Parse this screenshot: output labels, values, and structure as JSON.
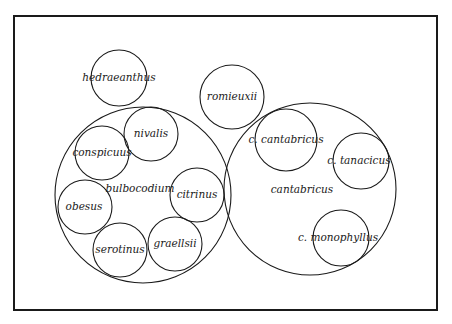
{
  "diagram": {
    "type": "nested-circle-taxonomy",
    "frame": {
      "x": 14,
      "y": 16,
      "width": 423,
      "height": 294
    },
    "line_color": "#1a1a1a",
    "background": "#ffffff",
    "groups": [
      {
        "id": "hedraeanthus",
        "label": "hedraeanthus",
        "cx": 119,
        "cy": 78,
        "r": 28
      },
      {
        "id": "romieuxii",
        "label": "romieuxii",
        "cx": 232,
        "cy": 97,
        "r": 32
      },
      {
        "id": "bulbocodium",
        "label": "bulbocodium",
        "cx": 143,
        "cy": 189,
        "r": 88,
        "label_pos": {
          "x": 138,
          "y": 192
        },
        "members": [
          {
            "id": "nivalis",
            "label": "nivalis",
            "cx": 151,
            "cy": 133,
            "r": 27
          },
          {
            "id": "conspicuus",
            "label": "conspicuus",
            "cx": 102,
            "cy": 153,
            "r": 27
          },
          {
            "id": "obesus",
            "label": "obesus",
            "cx": 85,
            "cy": 207,
            "r": 27
          },
          {
            "id": "citrinus",
            "label": "citrinus",
            "cx": 199,
            "cy": 194,
            "r": 27
          },
          {
            "id": "serotinus",
            "label": "serotinus",
            "cx": 120,
            "cy": 250,
            "r": 27
          },
          {
            "id": "graellsii",
            "label": "graellsii",
            "cx": 175,
            "cy": 245,
            "r": 27
          }
        ]
      },
      {
        "id": "cantabricus",
        "label": "cantabricus",
        "cx": 310,
        "cy": 189,
        "r": 86,
        "label_pos": {
          "x": 300,
          "y": 193
        },
        "members": [
          {
            "id": "c-cantabricus",
            "label": "c. cantabricus",
            "cx": 286,
            "cy": 140,
            "r": 31
          },
          {
            "id": "c-tanacicus",
            "label": "c. tanacicus",
            "cx": 361,
            "cy": 161,
            "r": 28
          },
          {
            "id": "c-monophyllus",
            "label": "c. monophyllus",
            "cx": 341,
            "cy": 238,
            "r": 28
          }
        ]
      }
    ]
  },
  "labels": {
    "hedraeanthus": "hedraeanthus",
    "romieuxii": "romieuxii",
    "bulbocodium": "bulbocodium",
    "nivalis": "nivalis",
    "conspicuus": "conspicuus",
    "obesus": "obesus",
    "citrinus": "citrinus",
    "serotinus": "serotinus",
    "graellsii": "graellsii",
    "cantabricus": "cantabricus",
    "c_cantabricus": "c. cantabricus",
    "c_tanacicus": "c. tanacicus",
    "c_monophyllus": "c. monophyllus"
  }
}
